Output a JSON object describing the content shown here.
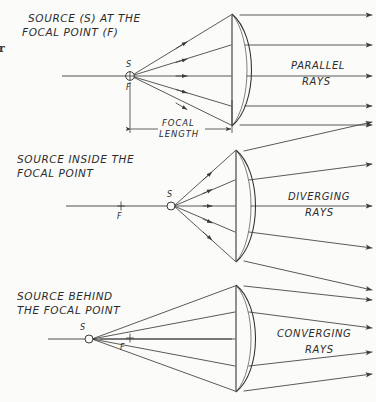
{
  "figure": {
    "kind": "optics-ray-diagram",
    "edge_artifact": "r",
    "ink_color": "#3c3c3c",
    "paper_color": "#fbfbfa"
  },
  "panels": [
    {
      "id": "panel-focal-point",
      "title_line1": "SOURCE (S) AT THE",
      "title_line2": "FOCAL POINT (F)",
      "ray_label_line1": "PARALLEL",
      "ray_label_line2": "RAYS",
      "source_label": "S",
      "focus_label": "F",
      "source_marker": "circled-cross",
      "dimension_line1": "FOCAL",
      "dimension_line2": "LENGTH",
      "ray_count": 5,
      "lens_type": "plano-convex"
    },
    {
      "id": "panel-inside-focal-point",
      "title_line1": "SOURCE INSIDE THE",
      "title_line2": "FOCAL POINT",
      "ray_label_line1": "DIVERGING",
      "ray_label_line2": "RAYS",
      "source_label": "S",
      "focus_label": "F",
      "source_marker": "open-circle",
      "ray_count": 5,
      "lens_type": "plano-convex"
    },
    {
      "id": "panel-behind-focal-point",
      "title_line1": "SOURCE BEHIND",
      "title_line2": "THE FOCAL POINT",
      "ray_label_line1": "CONVERGING",
      "ray_label_line2": "RAYS",
      "source_label": "S",
      "focus_label": "F",
      "source_marker": "open-circle",
      "ray_count": 5,
      "lens_type": "plano-convex"
    }
  ]
}
